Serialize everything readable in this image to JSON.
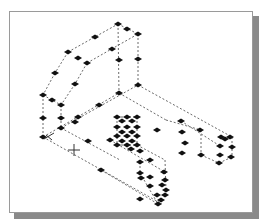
{
  "viewport": {
    "type": "isometric-wireframe",
    "background": "#ffffff",
    "frame_border": "#9a9a9a",
    "shadow": "#8a8a8a",
    "edge_color": "#6a6a6a",
    "grip_color": "#111111"
  },
  "cursor": {
    "type": "crosshair",
    "x": 74,
    "y": 150
  },
  "ucs_icon": {
    "x": 50,
    "y": 137
  },
  "grips": [
    [
      118,
      24
    ],
    [
      138,
      34
    ],
    [
      127,
      29
    ],
    [
      68,
      52
    ],
    [
      78,
      58
    ],
    [
      87,
      63
    ],
    [
      95,
      37
    ],
    [
      112,
      49
    ],
    [
      119,
      60
    ],
    [
      138,
      59
    ],
    [
      55,
      73
    ],
    [
      75,
      84
    ],
    [
      119,
      93
    ],
    [
      138,
      85
    ],
    [
      43,
      95
    ],
    [
      52,
      100
    ],
    [
      61,
      105
    ],
    [
      99,
      105
    ],
    [
      43,
      118
    ],
    [
      61,
      118
    ],
    [
      75,
      122
    ],
    [
      78,
      117
    ],
    [
      61,
      128
    ],
    [
      43,
      137
    ],
    [
      88,
      141
    ],
    [
      117,
      117
    ],
    [
      127,
      117
    ],
    [
      137,
      117
    ],
    [
      122,
      121
    ],
    [
      132,
      121
    ],
    [
      117,
      127
    ],
    [
      127,
      127
    ],
    [
      137,
      127
    ],
    [
      117,
      136
    ],
    [
      127,
      136
    ],
    [
      137,
      136
    ],
    [
      122,
      132
    ],
    [
      132,
      132
    ],
    [
      117,
      145
    ],
    [
      127,
      145
    ],
    [
      137,
      145
    ],
    [
      122,
      141
    ],
    [
      132,
      141
    ],
    [
      110,
      140
    ],
    [
      131,
      149
    ],
    [
      140,
      151
    ],
    [
      157,
      130
    ],
    [
      181,
      121
    ],
    [
      182,
      132
    ],
    [
      185,
      143
    ],
    [
      182,
      153
    ],
    [
      140,
      162
    ],
    [
      150,
      160
    ],
    [
      140,
      173
    ],
    [
      164,
      172
    ],
    [
      165,
      180
    ],
    [
      162,
      185
    ],
    [
      166,
      190
    ],
    [
      157,
      195
    ],
    [
      161,
      200
    ],
    [
      165,
      195
    ],
    [
      158,
      204
    ],
    [
      141,
      178
    ],
    [
      150,
      177
    ],
    [
      150,
      186
    ],
    [
      200,
      130
    ],
    [
      221,
      137
    ],
    [
      225,
      139
    ],
    [
      230,
      137
    ],
    [
      220,
      146
    ],
    [
      232,
      147
    ],
    [
      220,
      155
    ],
    [
      201,
      155
    ],
    [
      231,
      157
    ],
    [
      219,
      163
    ],
    [
      140,
      199
    ],
    [
      101,
      170
    ]
  ],
  "edges": [
    [
      68,
      52,
      118,
      24
    ],
    [
      118,
      24,
      138,
      34
    ],
    [
      87,
      63,
      138,
      34
    ],
    [
      68,
      52,
      55,
      73
    ],
    [
      55,
      73,
      43,
      95
    ],
    [
      87,
      63,
      75,
      84
    ],
    [
      75,
      84,
      61,
      105
    ],
    [
      118,
      24,
      119,
      93
    ],
    [
      138,
      34,
      138,
      85
    ],
    [
      43,
      95,
      43,
      137
    ],
    [
      61,
      105,
      61,
      128
    ],
    [
      43,
      95,
      61,
      105
    ],
    [
      43,
      137,
      119,
      93
    ],
    [
      61,
      128,
      138,
      85
    ],
    [
      43,
      137,
      162,
      204
    ],
    [
      61,
      128,
      120,
      160
    ],
    [
      138,
      85,
      232,
      137
    ],
    [
      119,
      93,
      166,
      120
    ],
    [
      232,
      137,
      232,
      157
    ],
    [
      219,
      163,
      232,
      157
    ],
    [
      201,
      155,
      219,
      163
    ],
    [
      201,
      130,
      201,
      155
    ],
    [
      166,
      120,
      201,
      130
    ],
    [
      181,
      121,
      220,
      146
    ],
    [
      117,
      117,
      137,
      117
    ],
    [
      117,
      145,
      137,
      145
    ],
    [
      117,
      117,
      117,
      145
    ],
    [
      137,
      117,
      137,
      145
    ],
    [
      137,
      145,
      165,
      160
    ],
    [
      165,
      160,
      166,
      190
    ],
    [
      140,
      162,
      140,
      173
    ],
    [
      140,
      173,
      158,
      204
    ],
    [
      110,
      140,
      165,
      172
    ],
    [
      101,
      170,
      158,
      204
    ]
  ]
}
